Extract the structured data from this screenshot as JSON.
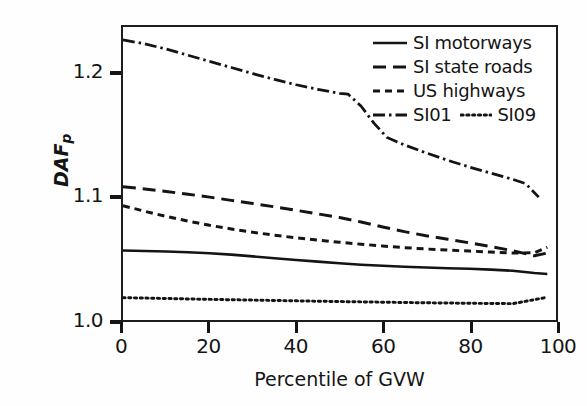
{
  "chart_data": {
    "type": "line",
    "title": "",
    "xlabel": "Percentile of GVW",
    "ylabel": "DAF",
    "ylabel_sub": "p",
    "xlim": [
      0,
      100
    ],
    "ylim": [
      1.0,
      1.2385
    ],
    "xticks": [
      0,
      20,
      40,
      60,
      80,
      100
    ],
    "xtick_labels": [
      "0",
      "20",
      "40",
      "60",
      "80",
      "100"
    ],
    "yticks": [
      1.0,
      1.1,
      1.2
    ],
    "ytick_labels": [
      "1.0",
      "1.1",
      "1.2"
    ],
    "grid": false,
    "legend_position": "top-right-inside",
    "line_color": "#141414",
    "series": [
      {
        "name": "SI motorways",
        "style": "solid",
        "x": [
          0,
          5,
          10,
          15,
          20,
          25,
          30,
          35,
          40,
          45,
          50,
          55,
          60,
          65,
          70,
          75,
          80,
          85,
          90,
          95,
          98
        ],
        "values": [
          1.0565,
          1.0562,
          1.0557,
          1.0551,
          1.0543,
          1.0532,
          1.0518,
          1.0503,
          1.0489,
          1.0475,
          1.0462,
          1.045,
          1.0441,
          1.0434,
          1.0428,
          1.0422,
          1.0417,
          1.041,
          1.0401,
          1.0382,
          1.0375
        ]
      },
      {
        "name": "SI state roads",
        "style": "dashed",
        "x": [
          0,
          5,
          10,
          15,
          20,
          25,
          30,
          35,
          40,
          45,
          50,
          55,
          60,
          65,
          70,
          75,
          80,
          85,
          90,
          95,
          98
        ],
        "values": [
          1.1085,
          1.1066,
          1.1046,
          1.1024,
          1.1,
          1.0974,
          1.0948,
          1.0921,
          1.0893,
          1.0864,
          1.0834,
          1.0798,
          1.0757,
          1.0719,
          1.0686,
          1.0657,
          1.0628,
          1.0597,
          1.0564,
          1.0523,
          1.0545
        ]
      },
      {
        "name": "US highways",
        "style": "dashed-fine",
        "x": [
          0,
          5,
          10,
          15,
          20,
          25,
          30,
          35,
          40,
          45,
          50,
          55,
          60,
          65,
          70,
          75,
          80,
          85,
          90,
          95,
          98
        ],
        "values": [
          1.093,
          1.0885,
          1.0843,
          1.0805,
          1.0771,
          1.0741,
          1.0714,
          1.069,
          1.0669,
          1.065,
          1.0633,
          1.0617,
          1.0602,
          1.0589,
          1.0578,
          1.0569,
          1.0561,
          1.0553,
          1.0545,
          1.0548,
          1.0592
        ]
      },
      {
        "name": "SI01",
        "style": "dash-dot",
        "x": [
          0,
          5,
          10,
          15,
          20,
          25,
          30,
          35,
          40,
          45,
          50,
          52,
          55,
          58,
          61,
          65,
          70,
          75,
          80,
          85,
          90,
          93,
          96
        ],
        "values": [
          1.228,
          1.2248,
          1.2205,
          1.2155,
          1.2105,
          1.2055,
          1.2005,
          1.1958,
          1.1915,
          1.1878,
          1.1845,
          1.1838,
          1.174,
          1.16,
          1.1485,
          1.1425,
          1.136,
          1.13,
          1.1245,
          1.1195,
          1.1145,
          1.111,
          1.1
        ]
      },
      {
        "name": "SI09",
        "style": "dotted",
        "x": [
          0,
          10,
          20,
          30,
          40,
          50,
          60,
          70,
          80,
          90,
          98
        ],
        "values": [
          1.0182,
          1.0175,
          1.0168,
          1.0162,
          1.0156,
          1.015,
          1.0145,
          1.014,
          1.0136,
          1.0133,
          1.0185
        ]
      }
    ]
  },
  "legend": {
    "items": [
      {
        "label": "SI motorways",
        "sample": "solid"
      },
      {
        "label": "SI state roads",
        "sample": "dashed"
      },
      {
        "label": "US highways",
        "sample": "dashed-fine"
      },
      {
        "label": "SI01",
        "sample": "dash-dot"
      },
      {
        "label": "SI09",
        "sample": "dotted"
      }
    ]
  }
}
